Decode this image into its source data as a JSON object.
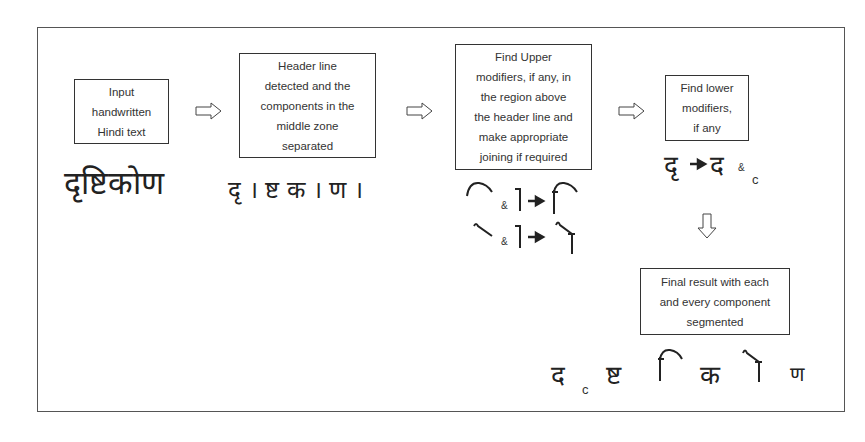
{
  "diagram": {
    "steps": [
      {
        "id": "input",
        "label": "Input handwritten Hindi text",
        "lines": [
          "Input",
          "handwritten",
          "Hindi text"
        ],
        "sample": "दृष्टिकोण"
      },
      {
        "id": "header",
        "label": "Header line detected and the components in the middle zone separated",
        "lines": [
          "Header line",
          "detected and the",
          "components in the",
          "middle zone",
          "separated"
        ],
        "sample": "दृ । ष्ट क । ण ।"
      },
      {
        "id": "upper",
        "label": "Find Upper modifiers, if any, in the region above the header line and make appropriate joining if required",
        "lines": [
          "Find Upper",
          "modifiers, if any, in",
          "the region above",
          "the header line and",
          "make appropriate",
          "joining if required"
        ],
        "joins": [
          {
            "a": "ि-curve",
            "sep": "&",
            "b": "।",
            "result": "ि"
          },
          {
            "a": "ो-stroke",
            "sep": "&",
            "b": "।",
            "result": "ो"
          }
        ]
      },
      {
        "id": "lower",
        "label": "Find lower modifiers, if any",
        "lines": [
          "Find lower",
          "modifiers,",
          "if any"
        ],
        "sample": {
          "from": "दृ",
          "to": "द",
          "sep": "&",
          "mod": "c"
        }
      },
      {
        "id": "final",
        "label": "Final result with each and every component segmented",
        "lines": [
          "Final result with each",
          "and every component",
          "segmented"
        ],
        "sample": [
          "द",
          "c",
          "ष्ट",
          "ि",
          "क",
          "ो",
          "ण"
        ]
      }
    ],
    "amp": "&",
    "lower_mod": "c",
    "arrows": [
      "right",
      "right",
      "right",
      "down"
    ],
    "colors": {
      "stroke": "#333333",
      "frame": "#555555",
      "text": "#333333"
    }
  }
}
